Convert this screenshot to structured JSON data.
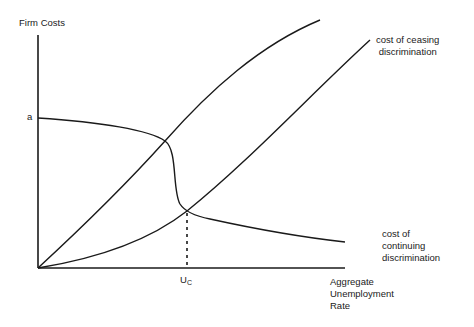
{
  "diagram": {
    "axes": {
      "y_label": "Firm Costs",
      "x_label_lines": [
        "Aggregate",
        "Unemployment",
        "Rate"
      ],
      "y_intercept_label": "a",
      "x_marker_label_main": "U",
      "x_marker_label_sub": "C"
    },
    "curves": [
      {
        "id": "cost-of-ceasing-discrimination",
        "label_lines": [
          "cost of ceasing",
          "discrimination"
        ]
      },
      {
        "id": "cost-of-continuing-discrimination",
        "label_lines": [
          "cost of",
          "continuing",
          "discrimination"
        ]
      },
      {
        "id": "upper-rising-curve",
        "label_lines": []
      }
    ],
    "colors": {
      "line": "#1a1a1a",
      "background": "#ffffff"
    }
  }
}
